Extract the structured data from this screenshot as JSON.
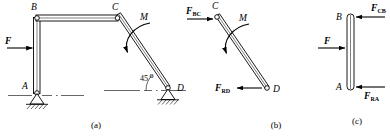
{
  "figure": {
    "stroke_color": "#000000",
    "background_color": "#ffffff",
    "parts": [
      {
        "caption": "(a)",
        "name": "assembled-frame",
        "joints": [
          "B",
          "C",
          "A",
          "D"
        ],
        "loads": [
          {
            "symbol": "F",
            "sub": "",
            "type": "force",
            "direction": "right"
          },
          {
            "symbol": "M",
            "sub": "",
            "type": "moment",
            "direction": "counterclockwise"
          }
        ],
        "angle_label": "45",
        "angle_unit": "o",
        "supports": [
          "pin-at-A",
          "pin-at-D"
        ]
      },
      {
        "caption": "(b)",
        "name": "member-cd-free-body",
        "joints": [
          "C",
          "D"
        ],
        "loads": [
          {
            "symbol": "F",
            "sub": "BC",
            "type": "force",
            "direction": "right"
          },
          {
            "symbol": "M",
            "sub": "",
            "type": "moment",
            "direction": "counterclockwise"
          },
          {
            "symbol": "F",
            "sub": "RD",
            "type": "force",
            "direction": "left"
          }
        ]
      },
      {
        "caption": "(c)",
        "name": "member-ab-free-body",
        "joints": [
          "B",
          "A"
        ],
        "loads": [
          {
            "symbol": "F",
            "sub": "CB",
            "type": "force",
            "direction": "left"
          },
          {
            "symbol": "F",
            "sub": "",
            "type": "force",
            "direction": "right"
          },
          {
            "symbol": "F",
            "sub": "RA",
            "type": "force",
            "direction": "left"
          }
        ]
      }
    ]
  },
  "labels": {
    "a_B": "B",
    "a_C": "C",
    "a_A": "A",
    "a_D": "D",
    "a_F": "F",
    "a_M": "M",
    "a_angle": "45",
    "a_angle_unit": "o",
    "a_caption": "(a)",
    "b_C": "C",
    "b_D": "D",
    "b_M": "M",
    "b_FBC": "F",
    "b_FBC_sub": "BC",
    "b_FRD": "F",
    "b_FRD_sub": "RD",
    "b_caption": "(b)",
    "c_B": "B",
    "c_A": "A",
    "c_F": "F",
    "c_FCB": "F",
    "c_FCB_sub": "CB",
    "c_FRA": "F",
    "c_FRA_sub": "RA",
    "c_caption": "(c)"
  }
}
